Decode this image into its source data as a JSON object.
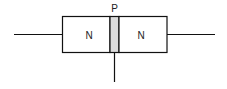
{
  "diagram": {
    "regions": [
      {
        "label": "N",
        "role": "left-n-region"
      },
      {
        "label": "P",
        "role": "base-p-region"
      },
      {
        "label": "N",
        "role": "right-n-region"
      }
    ],
    "colors": {
      "stroke": "#111111",
      "p_fill": "#dcdcdc",
      "background": "#ffffff"
    }
  }
}
